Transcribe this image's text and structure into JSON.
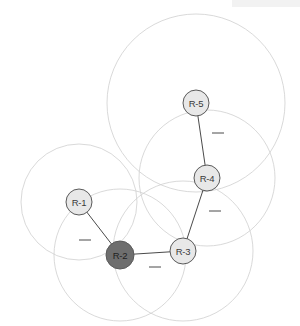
{
  "figure": {
    "type": "network-coverage-diagram",
    "background": "#ffffff",
    "width": 300,
    "height": 326,
    "header_band": {
      "present": true,
      "color": "#f2f2f2"
    }
  },
  "style": {
    "coverage_stroke": "#cfcfcf",
    "coverage_fill": "none",
    "coverage_stroke_width": 0.8,
    "link_stroke": "#4a4a4a",
    "link_stroke_width": 1.0,
    "node_light_fill": "#e8e8e8",
    "node_dark_fill": "#6e6e6e",
    "node_stroke": "#5a5a5a",
    "node_stroke_width": 1.0,
    "dash_stroke": "#4a4a4a",
    "dash_label": "—"
  },
  "nodes": [
    {
      "id": "R-1",
      "label": "R-1",
      "x": 79,
      "y": 202,
      "r": 13,
      "state": "light",
      "fill": "#e8e8e8"
    },
    {
      "id": "R-2",
      "label": "R-2",
      "x": 120,
      "y": 255,
      "r": 14,
      "state": "dark",
      "fill": "#6e6e6e"
    },
    {
      "id": "R-3",
      "label": "R-3",
      "x": 183,
      "y": 251,
      "r": 13,
      "state": "light",
      "fill": "#e8e8e8"
    },
    {
      "id": "R-4",
      "label": "R-4",
      "x": 207,
      "y": 178,
      "r": 13,
      "state": "light",
      "fill": "#e8e8e8"
    },
    {
      "id": "R-5",
      "label": "R-5",
      "x": 196,
      "y": 103,
      "r": 13,
      "state": "light",
      "fill": "#e8e8e8"
    }
  ],
  "coverage_circles": [
    {
      "node": "R-1",
      "cx": 79,
      "cy": 202,
      "r": 58
    },
    {
      "node": "R-2",
      "cx": 120,
      "cy": 255,
      "r": 66
    },
    {
      "node": "R-3",
      "cx": 183,
      "cy": 251,
      "r": 70
    },
    {
      "node": "R-4",
      "cx": 207,
      "cy": 178,
      "r": 68
    },
    {
      "node": "R-5",
      "cx": 196,
      "cy": 103,
      "r": 89
    }
  ],
  "links": [
    {
      "from": "R-1",
      "to": "R-2",
      "x1": 79,
      "y1": 202,
      "x2": 120,
      "y2": 255
    },
    {
      "from": "R-2",
      "to": "R-3",
      "x1": 120,
      "y1": 255,
      "x2": 183,
      "y2": 251
    },
    {
      "from": "R-3",
      "to": "R-4",
      "x1": 183,
      "y1": 251,
      "x2": 207,
      "y2": 178
    },
    {
      "from": "R-4",
      "to": "R-5",
      "x1": 207,
      "y1": 178,
      "x2": 196,
      "y2": 103
    }
  ],
  "link_marks": [
    {
      "for_link": "R-1_R-2",
      "label": "—",
      "x": 85,
      "y": 240
    },
    {
      "for_link": "R-2_R-3",
      "label": "—",
      "x": 155,
      "y": 267
    },
    {
      "for_link": "R-3_R-4",
      "label": "—",
      "x": 215,
      "y": 211
    },
    {
      "for_link": "R-4_R-5",
      "label": "—",
      "x": 218,
      "y": 133
    }
  ]
}
